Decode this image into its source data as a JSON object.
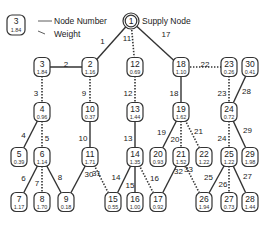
{
  "legend": {
    "sample_node": {
      "number": "3",
      "weight": "1.84"
    },
    "number_label": "Node Number",
    "weight_label": "Weight"
  },
  "supply": {
    "node": "1",
    "label": "Supply Node"
  },
  "nodes": [
    {
      "id": "2",
      "weight": "1.16"
    },
    {
      "id": "3",
      "weight": "1.84"
    },
    {
      "id": "4",
      "weight": "0.96"
    },
    {
      "id": "5",
      "weight": "0.39"
    },
    {
      "id": "6",
      "weight": "1.14"
    },
    {
      "id": "7",
      "weight": "1.17"
    },
    {
      "id": "8",
      "weight": "1.70"
    },
    {
      "id": "9",
      "weight": "0.18"
    },
    {
      "id": "10",
      "weight": "0.37"
    },
    {
      "id": "11",
      "weight": "1.71"
    },
    {
      "id": "12",
      "weight": "0.69"
    },
    {
      "id": "13",
      "weight": "1.44"
    },
    {
      "id": "14",
      "weight": "1.35"
    },
    {
      "id": "15",
      "weight": "0.55"
    },
    {
      "id": "16",
      "weight": "1.00"
    },
    {
      "id": "17",
      "weight": "0.92"
    },
    {
      "id": "18",
      "weight": "1.10"
    },
    {
      "id": "19",
      "weight": "1.62"
    },
    {
      "id": "20",
      "weight": "0.93"
    },
    {
      "id": "21",
      "weight": "1.52"
    },
    {
      "id": "22",
      "weight": "1.22"
    },
    {
      "id": "23",
      "weight": "0.26"
    },
    {
      "id": "24",
      "weight": "0.72"
    },
    {
      "id": "25",
      "weight": "1.22"
    },
    {
      "id": "26",
      "weight": "1.94"
    },
    {
      "id": "27",
      "weight": "0.73"
    },
    {
      "id": "28",
      "weight": "1.44"
    },
    {
      "id": "29",
      "weight": "1.98"
    },
    {
      "id": "30",
      "weight": "0.41"
    }
  ],
  "edges": [
    {
      "label": "1",
      "from": "1",
      "to": "2",
      "style": "solid"
    },
    {
      "label": "2",
      "from": "2",
      "to": "3",
      "style": "solid"
    },
    {
      "label": "3",
      "from": "3",
      "to": "4",
      "style": "dotted"
    },
    {
      "label": "4",
      "from": "4",
      "to": "5",
      "style": "solid"
    },
    {
      "label": "5",
      "from": "4",
      "to": "6",
      "style": "dotted"
    },
    {
      "label": "6",
      "from": "6",
      "to": "7",
      "style": "solid"
    },
    {
      "label": "7",
      "from": "6",
      "to": "8",
      "style": "dotted"
    },
    {
      "label": "8",
      "from": "6",
      "to": "9",
      "style": "solid"
    },
    {
      "label": "9",
      "from": "2",
      "to": "10",
      "style": "dotted"
    },
    {
      "label": "10",
      "from": "10",
      "to": "11",
      "style": "solid"
    },
    {
      "label": "11",
      "from": "1",
      "to": "12",
      "style": "dotted"
    },
    {
      "label": "12",
      "from": "12",
      "to": "13",
      "style": "dotted"
    },
    {
      "label": "13",
      "from": "13",
      "to": "14",
      "style": "solid"
    },
    {
      "label": "14",
      "from": "14",
      "to": "15",
      "style": "solid"
    },
    {
      "label": "15",
      "from": "14",
      "to": "16",
      "style": "solid"
    },
    {
      "label": "16",
      "from": "14",
      "to": "17",
      "style": "dotted"
    },
    {
      "label": "17",
      "from": "1",
      "to": "18",
      "style": "solid"
    },
    {
      "label": "18",
      "from": "18",
      "to": "19",
      "style": "solid"
    },
    {
      "label": "19",
      "from": "19",
      "to": "20",
      "style": "solid"
    },
    {
      "label": "20",
      "from": "19",
      "to": "21",
      "style": "dotted"
    },
    {
      "label": "21",
      "from": "19",
      "to": "22",
      "style": "dotted"
    },
    {
      "label": "22",
      "from": "18",
      "to": "23",
      "style": "dotted"
    },
    {
      "label": "23",
      "from": "23",
      "to": "24",
      "style": "dotted"
    },
    {
      "label": "24",
      "from": "24",
      "to": "25",
      "style": "dotted"
    },
    {
      "label": "25",
      "from": "25",
      "to": "26",
      "style": "solid"
    },
    {
      "label": "26",
      "from": "25",
      "to": "27",
      "style": "dotted"
    },
    {
      "label": "27",
      "from": "25",
      "to": "28",
      "style": "solid"
    },
    {
      "label": "28",
      "from": "24",
      "to": "30",
      "style": "solid"
    },
    {
      "label": "29",
      "from": "24",
      "to": "29",
      "style": "solid"
    },
    {
      "label": "30",
      "from": "11",
      "to": "9",
      "style": "solid"
    },
    {
      "label": "31",
      "from": "11",
      "to": "15",
      "style": "dotted"
    },
    {
      "label": "32",
      "from": "21",
      "to": "17",
      "style": "solid"
    },
    {
      "label": "33",
      "from": "21",
      "to": "26",
      "style": "dotted"
    }
  ]
}
